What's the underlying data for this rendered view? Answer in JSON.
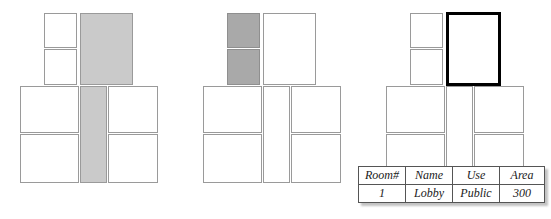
{
  "figure": {
    "background_color": "#ffffff",
    "panel_count": 3
  },
  "palette": {
    "cell_fill": "#ffffff",
    "cell_border": "#9a9a9a",
    "shade_light": "#cacaca",
    "shade_dark": "#a9a9a9",
    "highlight_border": "#000000",
    "table_border": "#555555",
    "text": "#1a1a1a"
  },
  "panels": [
    {
      "id": "panel-left",
      "name": "left-floor-plan",
      "shade_state": "light",
      "cells": [
        {
          "id": "L1",
          "name": "room-top-left-upper",
          "fill": "white"
        },
        {
          "id": "L2",
          "name": "room-top-left-lower",
          "fill": "white"
        },
        {
          "id": "L3",
          "name": "room-top-right-tall",
          "fill": "shade-light"
        },
        {
          "id": "L4",
          "name": "room-mid-left",
          "fill": "white"
        },
        {
          "id": "L5",
          "name": "room-mid-center-corridor",
          "fill": "shade-light"
        },
        {
          "id": "L6",
          "name": "room-mid-right",
          "fill": "white"
        },
        {
          "id": "L7",
          "name": "room-bottom-left",
          "fill": "white"
        },
        {
          "id": "L8",
          "name": "room-bottom-right",
          "fill": "white"
        }
      ]
    },
    {
      "id": "panel-middle",
      "name": "middle-floor-plan",
      "shade_state": "dark",
      "cells": [
        {
          "id": "M1",
          "name": "room-top-left-upper",
          "fill": "shade-dark"
        },
        {
          "id": "M2",
          "name": "room-top-left-lower",
          "fill": "shade-dark"
        },
        {
          "id": "M3",
          "name": "room-top-right-tall",
          "fill": "white"
        },
        {
          "id": "M4",
          "name": "room-mid-left",
          "fill": "white"
        },
        {
          "id": "M5",
          "name": "room-mid-center-corridor",
          "fill": "white"
        },
        {
          "id": "M6",
          "name": "room-mid-right",
          "fill": "white"
        },
        {
          "id": "M7",
          "name": "room-bottom-left",
          "fill": "white"
        },
        {
          "id": "M8",
          "name": "room-bottom-right",
          "fill": "white"
        }
      ]
    },
    {
      "id": "panel-right",
      "name": "right-floor-plan",
      "shade_state": "highlight",
      "cells": [
        {
          "id": "R1",
          "name": "room-top-left-upper",
          "fill": "white"
        },
        {
          "id": "R2",
          "name": "room-top-left-lower",
          "fill": "white"
        },
        {
          "id": "R3",
          "name": "room-top-right-tall-selected",
          "fill": "highlight"
        },
        {
          "id": "R4",
          "name": "room-mid-left",
          "fill": "white"
        },
        {
          "id": "R5",
          "name": "room-mid-center-corridor",
          "fill": "white"
        },
        {
          "id": "R6",
          "name": "room-mid-right",
          "fill": "white"
        },
        {
          "id": "R7",
          "name": "room-bottom-left",
          "fill": "white"
        },
        {
          "id": "R8",
          "name": "room-bottom-right",
          "fill": "white"
        }
      ]
    }
  ],
  "attribute_table": {
    "name": "room-attribute-table",
    "columns": [
      "Room#",
      "Name",
      "Use",
      "Area"
    ],
    "rows": [
      {
        "room_number": "1",
        "room_name": "Lobby",
        "use": "Public",
        "area": "300"
      }
    ]
  }
}
